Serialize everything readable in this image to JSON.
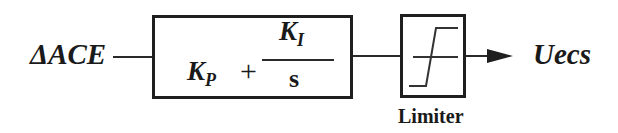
{
  "diagram": {
    "type": "block-diagram",
    "input": {
      "label": "ΔACE"
    },
    "controller": {
      "proportional": "K",
      "proportional_sub": "P",
      "plus": "+",
      "integral_num": "K",
      "integral_num_sub": "I",
      "integral_den": "s"
    },
    "limiter": {
      "label": "Limiter"
    },
    "output": {
      "label": "Uecs"
    },
    "colors": {
      "stroke": "#1f1f1f",
      "text": "#1a1a1a",
      "background": "#ffffff"
    }
  }
}
